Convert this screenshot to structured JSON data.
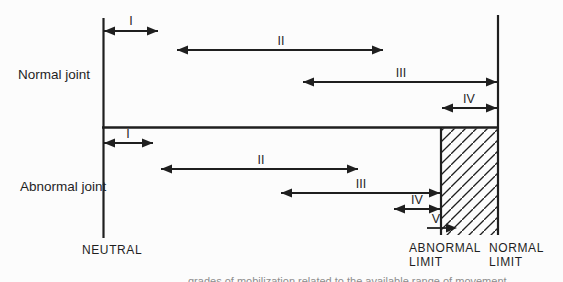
{
  "figure": {
    "sections": [
      {
        "name": "Normal joint",
        "grades": [
          {
            "label": "I"
          },
          {
            "label": "II"
          },
          {
            "label": "III"
          },
          {
            "label": "IV"
          }
        ]
      },
      {
        "name": "Abnormal joint",
        "grades": [
          {
            "label": "I"
          },
          {
            "label": "II"
          },
          {
            "label": "III"
          },
          {
            "label": "IV"
          },
          {
            "label": "V"
          }
        ]
      }
    ],
    "axis_labels": {
      "neutral": "NEUTRAL",
      "abnormal_limit_line1": "ABNORMAL",
      "abnormal_limit_line2": "LIMIT",
      "normal_limit_line1": "NORMAL",
      "normal_limit_line2": "LIMIT"
    },
    "caption_fragment": "grades of mobilization related to the available range of movement"
  },
  "colors": {
    "ink": "#1f1f1f",
    "background": "#fcfcfc",
    "caption_faint": "#8c8c8c"
  }
}
